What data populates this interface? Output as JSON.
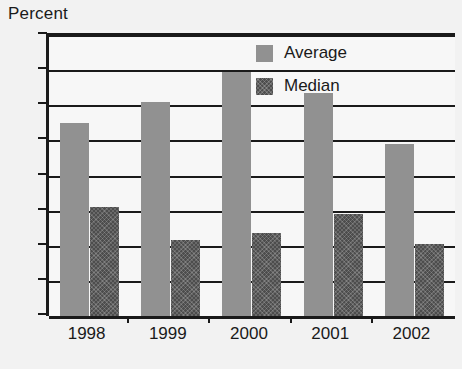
{
  "chart_data": {
    "type": "bar",
    "title": "",
    "subtitle": "",
    "xlabel": "",
    "ylabel": "Percent",
    "categories": [
      "1998",
      "1999",
      "2000",
      "2001",
      "2002"
    ],
    "series": [
      {
        "name": "Average",
        "color": "#919191",
        "values": [
          11.0,
          12.2,
          13.9,
          12.7,
          9.8
        ]
      },
      {
        "name": "Median",
        "color": "#4d4d4d",
        "values": [
          6.2,
          4.3,
          4.7,
          5.8,
          4.1
        ]
      }
    ],
    "ylim": [
      0,
      16
    ],
    "yticks": [
      0,
      2,
      4,
      6,
      8,
      10,
      12,
      14,
      16
    ],
    "ytick_labels": [
      "0",
      "2",
      "4",
      "6",
      "8",
      "10",
      "12",
      "14",
      "16"
    ],
    "grid": true,
    "grid_axis": "y",
    "legend_position": "top-right-inside",
    "annotations": []
  }
}
